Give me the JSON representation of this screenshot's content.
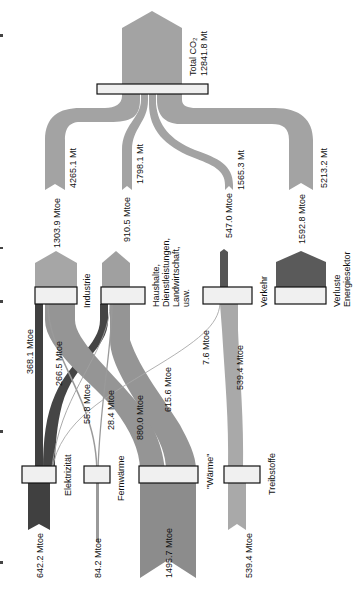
{
  "diagram": {
    "type": "sankey",
    "orientation": "rotated-90",
    "colors": {
      "co2_flow": "#a3a3a3",
      "industrie_arrow": "#a6a6a6",
      "haushalte_arrow": "#a0a0a0",
      "verkehr_arrow": "#555555",
      "verluste_arrow": "#5a5a5a",
      "elektrizitaet": "#404040",
      "waerme": "#8c8c8c",
      "fernwaerme": "#9a9a9a",
      "treibstoffe": "#a9a9a9",
      "node_fill": "#f0f0f0",
      "node_stroke": "#111111"
    },
    "total": {
      "label": "Total CO₂",
      "value": "12841.8 Mt"
    },
    "co2_split": [
      {
        "value": "4265.1 Mt"
      },
      {
        "value": "1798.1 Mt"
      },
      {
        "value": "1565.3 Mt"
      },
      {
        "value": "5213.2 Mt"
      }
    ],
    "sectors": [
      {
        "name": "Industrie",
        "value": "1303.9 Mtoe"
      },
      {
        "name": "Haushalte, Dienstleistungen, Landwirtschaft, usw.",
        "lines": [
          "Haushalte,",
          "Dienstleistungen,",
          "Landwirtschaft,",
          "usw."
        ],
        "value": "910.5 Mtoe"
      },
      {
        "name": "Verkehr",
        "value": "547.0 Mtoe"
      },
      {
        "name": "Verluste Energiesektor",
        "lines": [
          "Verluste",
          "Energiesektor"
        ],
        "value": "1592.8 Mtoe"
      }
    ],
    "links": [
      {
        "label": "368.1 Mtoe"
      },
      {
        "label": "266.5 Mtoe"
      },
      {
        "label": "55.8 Mtoe"
      },
      {
        "label": "28.4 Mtoe"
      },
      {
        "label": "880.0 Mtoe"
      },
      {
        "label": "615.6 Mtoe"
      },
      {
        "label": "7.6 Mtoe"
      },
      {
        "label": "539.4 Mtoe"
      }
    ],
    "end_uses": [
      {
        "name": "Elektrizität",
        "value": "642.2 Mtoe"
      },
      {
        "name": "Fernwärme",
        "value": "84.2 Mtoe"
      },
      {
        "name": "\"Wärme\"",
        "value": "1495.7 Mtoe"
      },
      {
        "name": "Treibstoffe",
        "value": "539.4 Mtoe"
      }
    ]
  }
}
